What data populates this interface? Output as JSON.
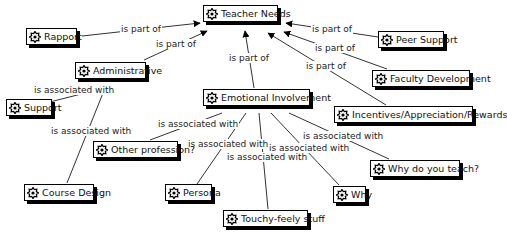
{
  "diagram": {
    "type": "concept-map",
    "colors": {
      "node_border": "#000000",
      "node_shadow": "#000000",
      "link": "#333333",
      "background": "#ffffff"
    },
    "nodes": [
      {
        "id": "teacher_needs",
        "label": "Teacher Needs",
        "icon": "concept-icon"
      },
      {
        "id": "rapport",
        "label": "Rapport",
        "icon": "concept-icon"
      },
      {
        "id": "peer_support",
        "label": "Peer Support",
        "icon": "concept-icon"
      },
      {
        "id": "administrative",
        "label": "Administrative",
        "icon": "concept-icon"
      },
      {
        "id": "faculty_development",
        "label": "Faculty Development",
        "icon": "concept-icon"
      },
      {
        "id": "support",
        "label": "Support",
        "icon": "concept-icon"
      },
      {
        "id": "emotional_involvement",
        "label": "Emotional Involvement",
        "icon": "concept-icon"
      },
      {
        "id": "incentives",
        "label": "Incentives/Appreciation/Rewards",
        "icon": "concept-icon"
      },
      {
        "id": "other_profession",
        "label": "Other profession?",
        "icon": "concept-icon"
      },
      {
        "id": "why_do_you_teach",
        "label": "Why do you teach?",
        "icon": "concept-icon"
      },
      {
        "id": "course_design",
        "label": "Course Design",
        "icon": "concept-icon"
      },
      {
        "id": "persona",
        "label": "Persona",
        "icon": "concept-icon"
      },
      {
        "id": "why",
        "label": "Why",
        "icon": "concept-icon"
      },
      {
        "id": "touchy_feely",
        "label": "Touchy-feely stuff",
        "icon": "concept-icon"
      }
    ],
    "links": [
      {
        "from": "rapport",
        "to": "teacher_needs",
        "label": "is part of",
        "arrow": true
      },
      {
        "from": "administrative",
        "to": "teacher_needs",
        "label": "is part of",
        "arrow": true
      },
      {
        "from": "emotional_involvement",
        "to": "teacher_needs",
        "label": "is part of",
        "arrow": true
      },
      {
        "from": "peer_support",
        "to": "teacher_needs",
        "label": "is part of",
        "arrow": true
      },
      {
        "from": "faculty_development",
        "to": "teacher_needs",
        "label": "is part of",
        "arrow": true
      },
      {
        "from": "incentives",
        "to": "teacher_needs",
        "label": "is part of",
        "arrow": true
      },
      {
        "from": "administrative",
        "to": "support",
        "label": "is associated with",
        "arrow": false
      },
      {
        "from": "administrative",
        "to": "course_design",
        "label": "is associated with",
        "arrow": false
      },
      {
        "from": "emotional_involvement",
        "to": "other_profession",
        "label": "is associated with",
        "arrow": false
      },
      {
        "from": "emotional_involvement",
        "to": "persona",
        "label": "is associated with",
        "arrow": false
      },
      {
        "from": "emotional_involvement",
        "to": "touchy_feely",
        "label": "is associated with",
        "arrow": false
      },
      {
        "from": "emotional_involvement",
        "to": "why",
        "label": "is associated with",
        "arrow": false
      },
      {
        "from": "emotional_involvement",
        "to": "why_do_you_teach",
        "label": "is associated with",
        "arrow": false
      }
    ]
  }
}
